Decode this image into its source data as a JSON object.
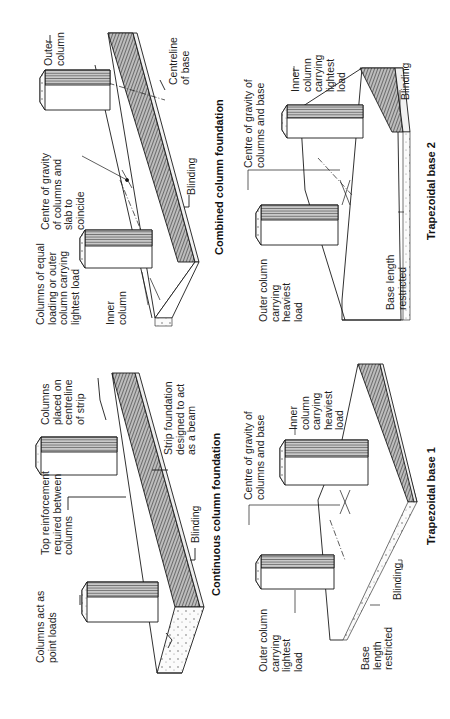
{
  "page": {
    "orientation": "rotated-90-ccw",
    "background": "#ffffff",
    "ink": "#1a1a1a"
  },
  "diagrams": {
    "continuous": {
      "title": "Continuous column foundation",
      "labels": {
        "point_loads": "Columns act as\npoint loads",
        "top_reinforcement": "Top reinforcement\nrequired between\ncolumns",
        "centreline": "Columns\nplaced on\ncentreline\nof strip",
        "strip_beam": "Strip foundation\ndesigned to act\nas a beam",
        "blinding": "Blinding"
      }
    },
    "combined": {
      "title": "Combined column foundation",
      "labels": {
        "equal_loading": "Columns of equal\nloading or outer\ncolumn carrying\nlightest load",
        "inner_column": "Inner\ncolumn",
        "centre_gravity": "Centre of gravity\nof columns and\nslab to\ncoincide",
        "outer_column": "Outer\ncolumn",
        "centreline_base": "Centreline\nof base",
        "blinding": "Blinding",
        "equal_mark": "="
      }
    },
    "trapezoidal1": {
      "title": "Trapezoidal base 1",
      "labels": {
        "outer_column": "Outer column\ncarrying\nlightest\nload",
        "centre_gravity": "Centre of gravity of\ncolumns and base",
        "inner_column": "Inner\ncolumn\ncarrying\nheaviest\nload",
        "base_length": "Base\nlength\nrestricted",
        "blinding": "Blinding"
      }
    },
    "trapezoidal2": {
      "title": "Trapezoidal base 2",
      "labels": {
        "outer_column": "Outer column\ncarrying\nheaviest\nload",
        "centre_gravity": "Centre of gravity of\ncolumns and base",
        "inner_column": "Inner\ncolumn\ncarrying\nlightest\nload",
        "base_length": "Base length\nrestricted",
        "blinding": "Blinding"
      }
    }
  }
}
